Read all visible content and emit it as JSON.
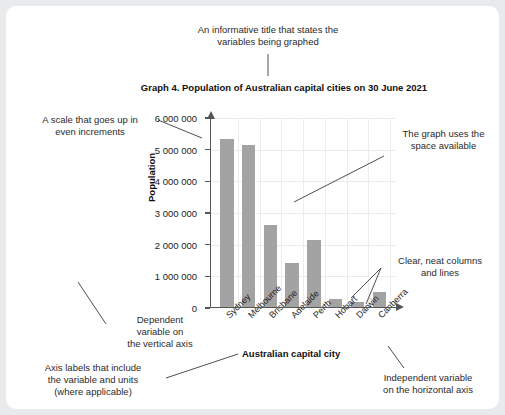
{
  "chart_title": "Graph 4. Population of Australian capital cities on 30 June 2021",
  "annotations": {
    "title_note": "An informative title that states the\nvariables being graphed",
    "scale_note": "A scale that goes up in\neven increments",
    "space_note": "The graph uses the\nspace available",
    "columns_note": "Clear, neat columns\nand lines",
    "dependent_note": "Dependent\nvariable on\nthe vertical axis",
    "axis_labels_note": "Axis labels that include\nthe variable and units\n(where applicable)",
    "independent_note": "Independent variable\non the horizontal axis"
  },
  "colors": {
    "bar": "#a3a3a3",
    "axis": "#555555",
    "grid": "#ebebeb",
    "card": "#ffffff",
    "page": "#e9eaec"
  },
  "chart_data": {
    "type": "bar",
    "title": "Graph 4. Population of Australian capital cities on 30 June 2021",
    "xlabel": "Australian capital city",
    "ylabel": "Population",
    "categories": [
      "Sydney",
      "Melbourne",
      "Brisbane",
      "Adelaide",
      "Perth",
      "Hobart",
      "Darwin",
      "Canberra"
    ],
    "values": [
      5300000,
      5100000,
      2580000,
      1380000,
      2110000,
      250000,
      150000,
      450000
    ],
    "ylim": [
      0,
      6000000
    ],
    "ytick_labels": [
      "0",
      "1 000 000",
      "2 000 000",
      "3 000 000",
      "4 000 000",
      "5 000 000",
      "6 000 000"
    ],
    "ytick_values": [
      0,
      1000000,
      2000000,
      3000000,
      4000000,
      5000000,
      6000000
    ],
    "grid": true,
    "legend": false
  }
}
